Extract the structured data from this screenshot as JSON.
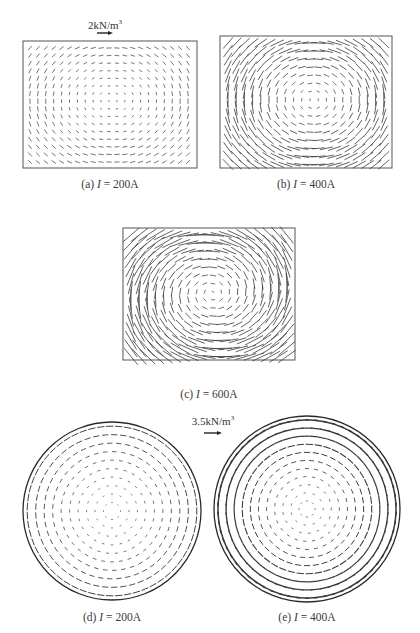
{
  "figure": {
    "panels": [
      {
        "id": "a",
        "type": "rect-field",
        "caption": {
          "prefix": "(a) ",
          "var": "I",
          "suffix": " = 200A"
        },
        "box": {
          "x": 23,
          "y": 41,
          "w": 174,
          "h": 127
        },
        "grid": {
          "cols": 21,
          "rows": 16,
          "x0": 30,
          "y0": 48,
          "dx": 7.9,
          "dy": 7.6
        },
        "field": {
          "cx": 112,
          "cy": 100,
          "base": 1.2,
          "gain": 0.045,
          "max": 4.5,
          "clip": false
        },
        "legend": {
          "text": "2kN/m",
          "sup": "3",
          "x": 105,
          "y": 18,
          "arrow": {
            "x1": 97,
            "x2": 113,
            "y": 33
          }
        }
      },
      {
        "id": "b",
        "type": "rect-field",
        "caption": {
          "prefix": "(b) ",
          "var": "I",
          "suffix": " = 400A"
        },
        "box": {
          "x": 220,
          "y": 36,
          "w": 172,
          "h": 132
        },
        "grid": {
          "cols": 20,
          "rows": 16,
          "x0": 228,
          "y0": 43,
          "dx": 8.2,
          "dy": 8.1
        },
        "field": {
          "cx": 313,
          "cy": 100,
          "base": 1.5,
          "gain": 0.17,
          "max": 14,
          "clip": false
        }
      },
      {
        "id": "c",
        "type": "rect-field",
        "caption": {
          "prefix": "(c) ",
          "var": "I",
          "suffix": " = 600A"
        },
        "box": {
          "x": 123,
          "y": 228,
          "w": 172,
          "h": 132
        },
        "grid": {
          "cols": 20,
          "rows": 16,
          "x0": 131,
          "y0": 235,
          "dx": 8.2,
          "dy": 8.1
        },
        "field": {
          "cx": 212,
          "cy": 293,
          "base": 2,
          "gain": 0.26,
          "max": 22,
          "clip": false,
          "tilt": 0.35
        }
      },
      {
        "id": "d",
        "type": "circle-field",
        "caption": {
          "prefix": "(d) ",
          "var": "I",
          "suffix": " = 200A"
        },
        "circle": {
          "cx": 112,
          "cy": 511,
          "r": 89
        },
        "rings": 10,
        "field": {
          "base": 1,
          "gain": 0.07,
          "max": 7,
          "stroke_min": 0.6,
          "stroke_max": 1.0
        }
      },
      {
        "id": "e",
        "type": "circle-field",
        "caption": {
          "prefix": "(e) ",
          "var": "I",
          "suffix": " = 400A"
        },
        "circle": {
          "cx": 307,
          "cy": 509,
          "r": 93
        },
        "rings": 11,
        "field": {
          "base": 1.2,
          "gain": 0.12,
          "max": 12,
          "stroke_min": 0.6,
          "stroke_max": 1.6
        },
        "legend": {
          "text": "3.5kN/m",
          "sup": "3",
          "x": 213,
          "y": 414,
          "arrow": {
            "x1": 204,
            "x2": 222,
            "y": 433
          }
        }
      }
    ],
    "caption_positions": {
      "a": {
        "x": 110,
        "y": 178
      },
      "b": {
        "x": 306,
        "y": 178
      },
      "c": {
        "x": 209,
        "y": 388
      },
      "d": {
        "x": 112,
        "y": 611
      },
      "e": {
        "x": 307,
        "y": 611
      }
    },
    "colors": {
      "line": "#3a3a3a",
      "box": "#555555",
      "circle": "#2a2a2a"
    }
  }
}
